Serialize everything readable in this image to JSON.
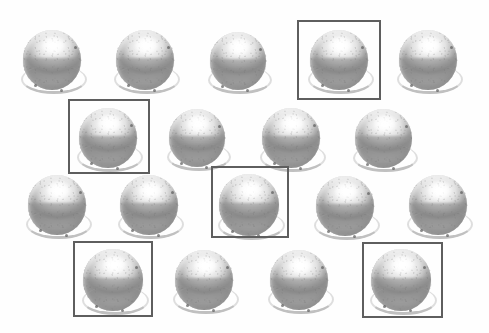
{
  "canvas": {
    "width": 489,
    "height": 333,
    "background_color": "#fefefe",
    "description": "Grid of metallic grey spheres with rectangular selection boxes"
  },
  "style": {
    "sphere_fill_light": "#ffffff",
    "sphere_fill_mid": "#c2c2c2",
    "sphere_fill_dark": "#8e8e8e",
    "sphere_rim_color": "#a9a9a9",
    "selection_box_color": "#5e5e5e",
    "selection_box_width": 2
  },
  "counts": {
    "total_spheres": 18,
    "selected_spheres": 5,
    "rows": 4
  },
  "rows": [
    {
      "index": 0,
      "count": 5
    },
    {
      "index": 1,
      "count": 4
    },
    {
      "index": 2,
      "count": 5
    },
    {
      "index": 3,
      "count": 4
    }
  ],
  "spheres": [
    {
      "id": "sphere-r1-c1",
      "row": 0,
      "col": 0,
      "x": 18,
      "y": 26,
      "size": 68,
      "selected": false
    },
    {
      "id": "sphere-r1-c2",
      "row": 0,
      "col": 1,
      "x": 111,
      "y": 26,
      "size": 68,
      "selected": false
    },
    {
      "id": "sphere-r1-c3",
      "row": 0,
      "col": 2,
      "x": 205,
      "y": 28,
      "size": 66,
      "selected": false
    },
    {
      "id": "sphere-r1-c4",
      "row": 0,
      "col": 3,
      "x": 305,
      "y": 26,
      "size": 68,
      "selected": true
    },
    {
      "id": "sphere-r1-c5",
      "row": 0,
      "col": 4,
      "x": 394,
      "y": 26,
      "size": 68,
      "selected": false
    },
    {
      "id": "sphere-r2-c1",
      "row": 1,
      "col": 0,
      "x": 74,
      "y": 104,
      "size": 68,
      "selected": true
    },
    {
      "id": "sphere-r2-c2",
      "row": 1,
      "col": 1,
      "x": 164,
      "y": 105,
      "size": 66,
      "selected": false
    },
    {
      "id": "sphere-r2-c3",
      "row": 1,
      "col": 2,
      "x": 257,
      "y": 104,
      "size": 68,
      "selected": false
    },
    {
      "id": "sphere-r2-c4",
      "row": 1,
      "col": 3,
      "x": 350,
      "y": 105,
      "size": 67,
      "selected": false
    },
    {
      "id": "sphere-r3-c1",
      "row": 2,
      "col": 0,
      "x": 23,
      "y": 171,
      "size": 68,
      "selected": false
    },
    {
      "id": "sphere-r3-c2",
      "row": 2,
      "col": 1,
      "x": 115,
      "y": 171,
      "size": 68,
      "selected": false
    },
    {
      "id": "sphere-r3-c3",
      "row": 2,
      "col": 2,
      "x": 214,
      "y": 170,
      "size": 70,
      "selected": true
    },
    {
      "id": "sphere-r3-c4",
      "row": 2,
      "col": 3,
      "x": 311,
      "y": 172,
      "size": 68,
      "selected": false
    },
    {
      "id": "sphere-r3-c5",
      "row": 2,
      "col": 4,
      "x": 404,
      "y": 171,
      "size": 68,
      "selected": false
    },
    {
      "id": "sphere-r4-c1",
      "row": 3,
      "col": 0,
      "x": 78,
      "y": 245,
      "size": 70,
      "selected": true
    },
    {
      "id": "sphere-r4-c2",
      "row": 3,
      "col": 1,
      "x": 170,
      "y": 246,
      "size": 68,
      "selected": false
    },
    {
      "id": "sphere-r4-c3",
      "row": 3,
      "col": 2,
      "x": 265,
      "y": 246,
      "size": 68,
      "selected": false
    },
    {
      "id": "sphere-r4-c4",
      "row": 3,
      "col": 3,
      "x": 366,
      "y": 245,
      "size": 70,
      "selected": true
    }
  ],
  "selection_boxes": [
    {
      "id": "selection-box-1",
      "target": "sphere-r1-c4",
      "x": 297,
      "y": 20,
      "width": 84,
      "height": 80
    },
    {
      "id": "selection-box-2",
      "target": "sphere-r2-c1",
      "x": 68,
      "y": 99,
      "width": 82,
      "height": 75
    },
    {
      "id": "selection-box-3",
      "target": "sphere-r3-c3",
      "x": 211,
      "y": 166,
      "width": 78,
      "height": 72
    },
    {
      "id": "selection-box-4",
      "target": "sphere-r4-c1",
      "x": 73,
      "y": 241,
      "width": 80,
      "height": 76
    },
    {
      "id": "selection-box-5",
      "target": "sphere-r4-c4",
      "x": 362,
      "y": 242,
      "width": 81,
      "height": 76
    }
  ]
}
